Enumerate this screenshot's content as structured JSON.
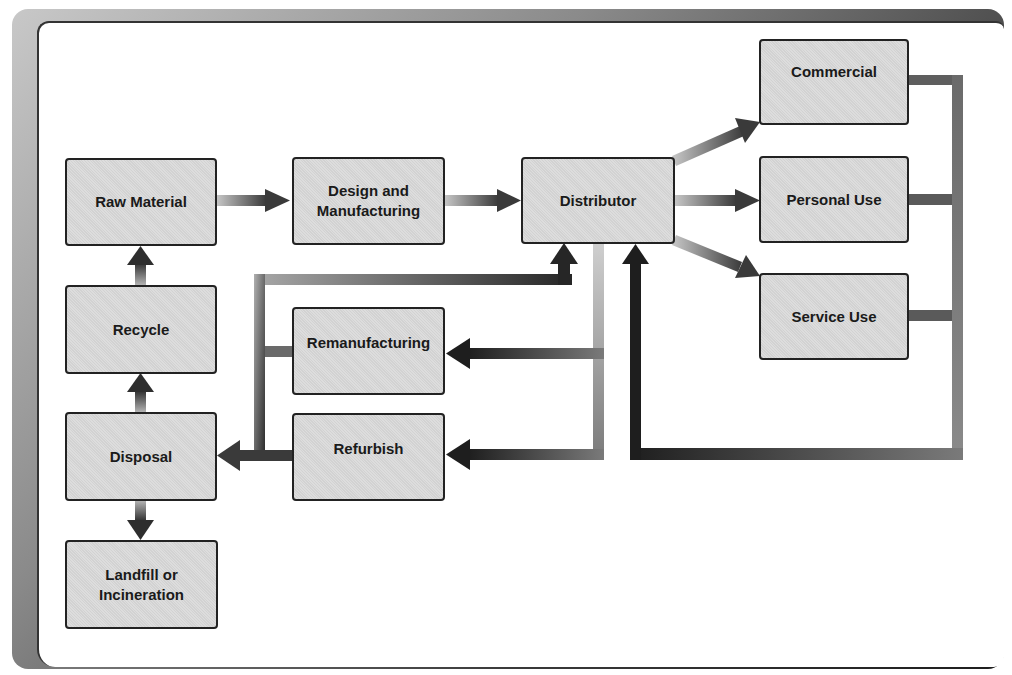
{
  "diagram": {
    "title": "",
    "nodes": {
      "raw_material": "Raw Material",
      "design_manufacturing": "Design and\nManufacturing",
      "distributor": "Distributor",
      "commercial": "Commercial",
      "personal_use": "Personal Use",
      "service_use": "Service Use",
      "recycle": "Recycle",
      "remanufacturing": "Remanufacturing",
      "refurbish": "Refurbish",
      "disposal": "Disposal",
      "landfill": "Landfill or\nIncineration"
    },
    "edges": [
      {
        "from": "Raw Material",
        "to": "Design and Manufacturing"
      },
      {
        "from": "Design and Manufacturing",
        "to": "Distributor"
      },
      {
        "from": "Distributor",
        "to": "Commercial"
      },
      {
        "from": "Distributor",
        "to": "Personal Use"
      },
      {
        "from": "Distributor",
        "to": "Service Use"
      },
      {
        "from": "Commercial",
        "to": "Distributor"
      },
      {
        "from": "Personal Use",
        "to": "Distributor"
      },
      {
        "from": "Service Use",
        "to": "Distributor"
      },
      {
        "from": "Distributor",
        "to": "Remanufacturing"
      },
      {
        "from": "Distributor",
        "to": "Refurbish"
      },
      {
        "from": "Remanufacturing",
        "to": "Distributor"
      },
      {
        "from": "Refurbish",
        "to": "Distributor"
      },
      {
        "from": "Remanufacturing",
        "to": "Disposal"
      },
      {
        "from": "Refurbish",
        "to": "Disposal"
      },
      {
        "from": "Disposal",
        "to": "Recycle"
      },
      {
        "from": "Recycle",
        "to": "Raw Material"
      },
      {
        "from": "Disposal",
        "to": "Landfill or Incineration"
      }
    ],
    "colors": {
      "box_fill": "#d9d9d9",
      "box_border": "#222222",
      "arrow_dark": "#2a2a2a",
      "arrow_light": "#c4c4c4"
    }
  }
}
